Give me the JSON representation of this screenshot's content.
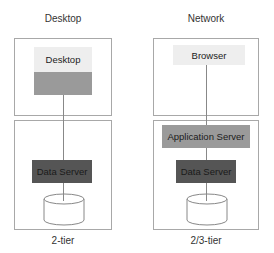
{
  "columns": [
    {
      "title": "Desktop",
      "caption": "2-tier",
      "top_boxes": [
        {
          "label": "Desktop",
          "shade": "light"
        },
        {
          "label": "",
          "shade": "mid"
        }
      ],
      "bottom_boxes": [
        {
          "label": "Data Server",
          "shade": "dark"
        }
      ],
      "database": "cylinder"
    },
    {
      "title": "Network",
      "caption": "2/3-tier",
      "top_boxes": [
        {
          "label": "Browser",
          "shade": "light"
        }
      ],
      "bottom_boxes": [
        {
          "label": "Application Server",
          "shade": "mid"
        },
        {
          "label": "Data Server",
          "shade": "dark"
        }
      ],
      "database": "cylinder"
    }
  ],
  "colors": {
    "frame_border": "#a8a8a8",
    "light_box": "#eeeeee",
    "mid_box": "#9a9a9a",
    "dark_box": "#555555",
    "connector": "#888888"
  }
}
